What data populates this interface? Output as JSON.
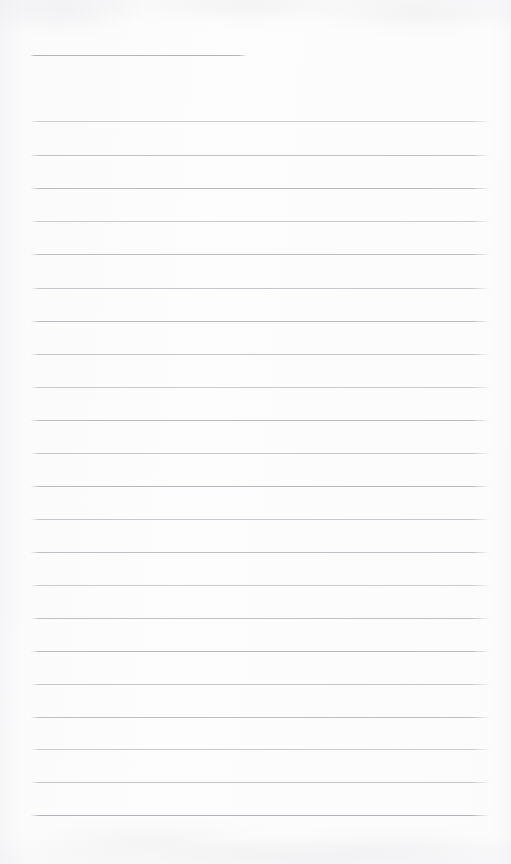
{
  "document": {
    "type": "scanned-lined-paper",
    "title": "Blank ruled notebook page",
    "page_width": 511,
    "page_height": 864,
    "background_color": "#fdfdfd",
    "rule_color": "#b9b9c0",
    "rule_color_light": "#cfcfd6",
    "has_handwriting": false,
    "has_text": false,
    "has_margin_line": false,
    "visible_text": "",
    "notes": "Empty scanned page of ruled paper. No headings, labels, numbers or handwriting are present in the pixels."
  },
  "ruling": {
    "line_count": 23,
    "full_width_line_count": 22,
    "partial_line_count": 1,
    "line_spacing_px": 33,
    "left_margin_px": 30,
    "right_edge_px": 490,
    "first_line_y": 55,
    "last_line_y": 815,
    "bottom_blank_space_px": 49,
    "lines": [
      {
        "y": 55,
        "x1": 30,
        "x2": 247,
        "opacity": 0.95,
        "color": "#b0b0b8"
      },
      {
        "y": 121,
        "x1": 30,
        "x2": 490,
        "opacity": 0.78,
        "color": "#bfbfc6"
      },
      {
        "y": 155,
        "x1": 30,
        "x2": 490,
        "opacity": 0.85,
        "color": "#b6b6be"
      },
      {
        "y": 188,
        "x1": 30,
        "x2": 490,
        "opacity": 0.9,
        "color": "#b2b2ba"
      },
      {
        "y": 221,
        "x1": 30,
        "x2": 490,
        "opacity": 0.8,
        "color": "#bcbcc4"
      },
      {
        "y": 254,
        "x1": 30,
        "x2": 490,
        "opacity": 0.88,
        "color": "#b4b4bc"
      },
      {
        "y": 288,
        "x1": 30,
        "x2": 490,
        "opacity": 0.82,
        "color": "#babac2"
      },
      {
        "y": 321,
        "x1": 30,
        "x2": 490,
        "opacity": 0.9,
        "color": "#b1b1b9"
      },
      {
        "y": 354,
        "x1": 30,
        "x2": 490,
        "opacity": 0.84,
        "color": "#b8b8c0"
      },
      {
        "y": 387,
        "x1": 30,
        "x2": 490,
        "opacity": 0.79,
        "color": "#bdbdc5"
      },
      {
        "y": 420,
        "x1": 30,
        "x2": 490,
        "opacity": 0.88,
        "color": "#b3b3bb"
      },
      {
        "y": 453,
        "x1": 30,
        "x2": 490,
        "opacity": 0.83,
        "color": "#b9b9c1"
      },
      {
        "y": 486,
        "x1": 30,
        "x2": 490,
        "opacity": 0.9,
        "color": "#b0b0b8"
      },
      {
        "y": 519,
        "x1": 30,
        "x2": 490,
        "opacity": 0.81,
        "color": "#bbbbc3"
      },
      {
        "y": 552,
        "x1": 30,
        "x2": 490,
        "opacity": 0.87,
        "color": "#b5b5bd"
      },
      {
        "y": 585,
        "x1": 30,
        "x2": 490,
        "opacity": 0.8,
        "color": "#bcbcc4"
      },
      {
        "y": 618,
        "x1": 30,
        "x2": 490,
        "opacity": 0.86,
        "color": "#b6b6be"
      },
      {
        "y": 651,
        "x1": 30,
        "x2": 490,
        "opacity": 0.89,
        "color": "#b2b2ba"
      },
      {
        "y": 684,
        "x1": 30,
        "x2": 490,
        "opacity": 0.82,
        "color": "#babac2"
      },
      {
        "y": 717,
        "x1": 30,
        "x2": 490,
        "opacity": 0.87,
        "color": "#b5b5bd"
      },
      {
        "y": 749,
        "x1": 30,
        "x2": 490,
        "opacity": 0.8,
        "color": "#bdbdc5"
      },
      {
        "y": 782,
        "x1": 30,
        "x2": 490,
        "opacity": 0.85,
        "color": "#b7b7bf"
      },
      {
        "y": 815,
        "x1": 30,
        "x2": 490,
        "opacity": 0.92,
        "color": "#adadb6"
      }
    ]
  }
}
